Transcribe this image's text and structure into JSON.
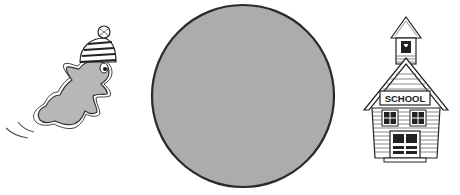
{
  "figure": {
    "left_item": {
      "name": "running-frog",
      "icon": "frog-icon"
    },
    "middle_item": {
      "name": "gray-circle",
      "fill": "#a9a9a9",
      "stroke": "#2b2b2b"
    },
    "right_item": {
      "name": "schoolhouse",
      "icon": "schoolhouse-icon",
      "sign_text": "SCHOOL"
    }
  }
}
